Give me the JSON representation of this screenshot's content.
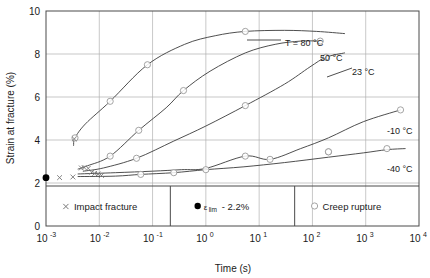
{
  "chart_data": {
    "type": "line",
    "title": "",
    "xlabel": "Time (s)",
    "ylabel": "Strain at fracture (%)",
    "xscale": "log",
    "xlim": [
      0.001,
      10000
    ],
    "ylim": [
      0,
      10
    ],
    "grid": true,
    "xticks": [
      "10-3",
      "10-2",
      "10-1",
      "100",
      "101",
      "102",
      "103",
      "104"
    ],
    "xtick_mantissas": [
      "10",
      "10",
      "10",
      "10",
      "10",
      "10",
      "10",
      "10"
    ],
    "xtick_exponents": [
      "-3",
      "-2",
      "-1",
      "0",
      "1",
      "2",
      "3",
      "4"
    ],
    "yticks": [
      "0",
      "2",
      "4",
      "6",
      "8",
      "10"
    ],
    "legend_position": "inside-bottom",
    "series": [
      {
        "name": "T = 80 °C",
        "label": "T = 80 °C",
        "x": [
          0.0033,
          0.0035,
          0.0055,
          0.016,
          0.08,
          0.4,
          1.5,
          5.5,
          30,
          120,
          400
        ],
        "y": [
          3.75,
          4.1,
          4.75,
          5.8,
          7.5,
          8.45,
          8.85,
          9.05,
          9.1,
          9.05,
          8.95
        ],
        "markers_x": [
          0.0035,
          0.016,
          0.08,
          5.5
        ],
        "markers_y": [
          4.1,
          5.8,
          7.5,
          9.05
        ],
        "marker": "circle-open"
      },
      {
        "name": "50 °C",
        "label": "50 °C",
        "x": [
          0.004,
          0.006,
          0.016,
          0.055,
          0.18,
          0.38,
          1.2,
          5.5,
          20,
          60,
          140
        ],
        "y": [
          2.65,
          2.8,
          3.25,
          4.45,
          5.5,
          6.3,
          7.2,
          8.05,
          8.45,
          8.6,
          8.6
        ],
        "markers_x": [
          0.016,
          0.055,
          0.38,
          140
        ],
        "markers_y": [
          3.25,
          4.45,
          6.3,
          8.6
        ],
        "marker": "circle-open"
      },
      {
        "name": "23 °C",
        "label": "23 °C",
        "x": [
          0.005,
          0.012,
          0.05,
          0.25,
          1.0,
          5.5,
          30,
          90,
          180,
          400
        ],
        "y": [
          2.55,
          2.7,
          3.15,
          3.95,
          4.65,
          5.6,
          6.6,
          7.4,
          7.85,
          8.05
        ],
        "markers_x": [
          0.05,
          5.5,
          180
        ],
        "markers_y": [
          3.15,
          5.6,
          7.85
        ],
        "marker": "circle-open"
      },
      {
        "name": "-10 °C",
        "label": "-10 °C",
        "x": [
          0.004,
          0.02,
          0.1,
          0.35,
          1.0,
          5.5,
          16,
          60,
          200,
          900,
          4500
        ],
        "y": [
          2.42,
          2.48,
          2.55,
          2.62,
          2.68,
          3.25,
          3.1,
          3.6,
          4.1,
          4.85,
          5.4
        ],
        "markers_x": [
          5.5,
          16,
          200,
          4500
        ],
        "markers_y": [
          3.25,
          3.1,
          3.45,
          5.4
        ],
        "marker": "circle-open"
      },
      {
        "name": "-40 °C",
        "label": "-40 °C",
        "x": [
          0.004,
          0.02,
          0.06,
          0.25,
          1.0,
          5.0,
          30,
          200,
          900,
          2500,
          5500
        ],
        "y": [
          2.3,
          2.32,
          2.4,
          2.48,
          2.62,
          2.75,
          2.95,
          3.2,
          3.4,
          3.55,
          3.6
        ],
        "markers_x": [
          0.06,
          0.25,
          1.0,
          200,
          2500
        ],
        "markers_y": [
          2.4,
          2.48,
          2.62,
          3.45,
          3.6
        ],
        "marker": "circle-open"
      }
    ],
    "impact_fracture_points": {
      "x": [
        0.0018,
        0.0032,
        0.0034,
        0.0046,
        0.0052,
        0.0062,
        0.0072,
        0.0082,
        0.0095,
        0.011
      ],
      "y": [
        2.25,
        2.28,
        4.05,
        2.7,
        2.72,
        2.68,
        2.5,
        2.45,
        2.42,
        2.35
      ]
    },
    "eps_lim_point": {
      "x": 0.001,
      "y": 2.25
    }
  },
  "legend": {
    "items": [
      {
        "marker": "x-cross",
        "label": "Impact fracture"
      },
      {
        "marker": "filled-dot",
        "symbol": "ε",
        "subscript": "lim",
        "label": "- 2.2%"
      },
      {
        "marker": "circle-open",
        "label": "Creep  rupture"
      }
    ]
  },
  "colors": {
    "curve": "#3b3b3b",
    "grid": "#b0b0b0",
    "axis": "#4a4a4a",
    "text": "#1a1a1a",
    "marker_edge": "#9a9a9a",
    "dot_fill": "#000000"
  }
}
